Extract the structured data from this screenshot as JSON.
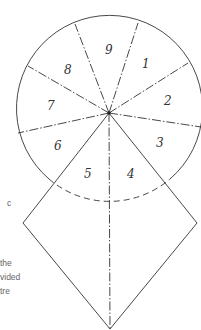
{
  "diagram": {
    "type": "circle divided into nine segments with square overlay",
    "segment_labels": [
      "1",
      "2",
      "3",
      "4",
      "5",
      "6",
      "7",
      "8",
      "9"
    ],
    "figure_label": "c",
    "caption_fragments": [
      "the",
      "vided",
      "tre"
    ]
  },
  "colors": {
    "line": "#333333",
    "text": "#666666",
    "background": "#ffffff"
  }
}
